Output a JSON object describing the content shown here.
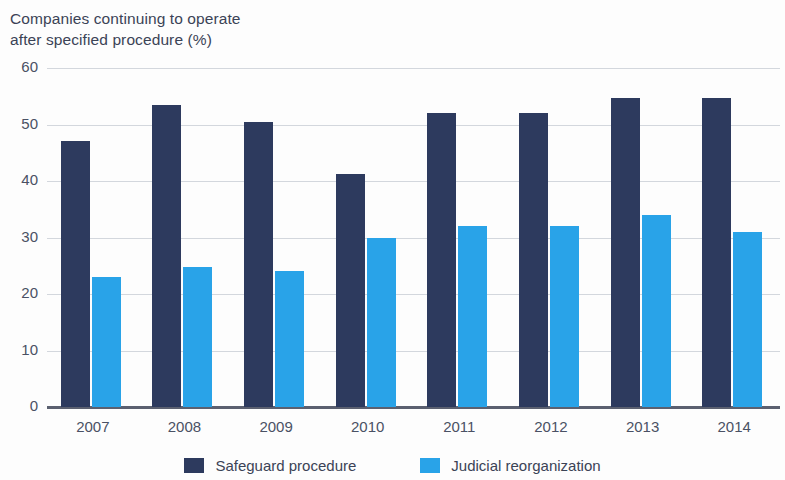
{
  "chart_data": {
    "type": "bar",
    "title": "Companies continuing to operate\nafter specified procedure (%)",
    "xlabel": "",
    "ylabel": "",
    "categories": [
      "2007",
      "2008",
      "2009",
      "2010",
      "2011",
      "2012",
      "2013",
      "2014"
    ],
    "series": [
      {
        "name": "Safeguard procedure",
        "color": "#2d3a5e",
        "values": [
          47,
          53.5,
          50.5,
          41.3,
          52,
          52,
          54.7,
          54.7
        ]
      },
      {
        "name": "Judicial reorganization",
        "color": "#29a3e8",
        "values": [
          23,
          24.8,
          24,
          30,
          32,
          32,
          34,
          31
        ]
      }
    ],
    "ylim": [
      0,
      60
    ],
    "yticks": [
      0,
      10,
      20,
      30,
      40,
      50,
      60
    ],
    "ytick_labels": [
      "0",
      "10",
      "20",
      "30",
      "40",
      "50",
      "60"
    ],
    "grid": true,
    "legend_position": "bottom"
  },
  "axis": {
    "y_tick_labels": [
      "60",
      "50",
      "40",
      "30",
      "20",
      "10",
      "0"
    ],
    "x_tick_labels": [
      "2007",
      "2008",
      "2009",
      "2010",
      "2011",
      "2012",
      "2013",
      "2014"
    ]
  },
  "legend": {
    "items": [
      {
        "label": "Safeguard procedure",
        "color": "#2d3a5e"
      },
      {
        "label": "Judicial reorganization",
        "color": "#29a3e8"
      }
    ]
  },
  "colors": {
    "series_dark": "#2d3a5e",
    "series_light": "#29a3e8",
    "gridline": "#d3d7dd",
    "axis_line": "#5b6070",
    "text": "#3b4356",
    "background": "#fdfdfd"
  }
}
